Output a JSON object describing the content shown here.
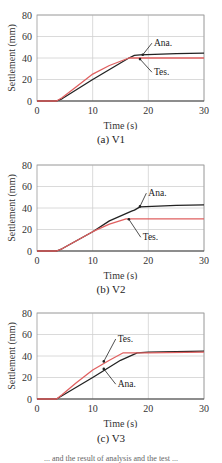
{
  "chart_data": [
    {
      "type": "line",
      "title": "",
      "caption": "(a)   V1",
      "xlabel": "Time (s)",
      "ylabel": "Settlement (mm)",
      "xlim": [
        0,
        30
      ],
      "ylim": [
        0,
        80
      ],
      "xticks": [
        0,
        10,
        20,
        30
      ],
      "yticks": [
        0,
        20,
        40,
        60,
        80
      ],
      "grid": true,
      "series": [
        {
          "name": "Ana.",
          "color": "#222222",
          "x": [
            0,
            3.5,
            4.5,
            10,
            16.5,
            17.5,
            18.5,
            25,
            30
          ],
          "y": [
            0,
            0,
            2,
            20,
            40,
            42.5,
            43,
            44,
            44.5
          ]
        },
        {
          "name": "Tes.",
          "color": "#e06060",
          "x": [
            0,
            3.5,
            4.5,
            7,
            10,
            13,
            16.5,
            30
          ],
          "y": [
            0,
            0,
            3,
            13,
            25,
            33,
            40,
            40
          ]
        }
      ],
      "annotations": [
        {
          "text": "Ana.",
          "x": 21,
          "y": 51,
          "arrow_to": [
            19,
            43
          ]
        },
        {
          "text": "Tes.",
          "x": 21,
          "y": 24,
          "arrow_to": [
            18.5,
            39
          ]
        }
      ]
    },
    {
      "type": "line",
      "title": "",
      "caption": "(b)   V2",
      "xlabel": "Time (s)",
      "ylabel": "Settlement (mm)",
      "xlim": [
        0,
        30
      ],
      "ylim": [
        0,
        80
      ],
      "xticks": [
        0,
        10,
        20,
        30
      ],
      "yticks": [
        0,
        20,
        40,
        60,
        80
      ],
      "grid": true,
      "series": [
        {
          "name": "Ana.",
          "color": "#222222",
          "x": [
            0,
            3.5,
            4.5,
            10,
            13,
            17,
            17.5,
            18.5,
            25,
            30
          ],
          "y": [
            0,
            0,
            2,
            18,
            28,
            37,
            38,
            41,
            42.5,
            43
          ]
        },
        {
          "name": "Tes.",
          "color": "#e06060",
          "x": [
            0,
            3.5,
            4.5,
            10,
            13,
            16,
            30
          ],
          "y": [
            0,
            0,
            2,
            18,
            25,
            30,
            30
          ]
        }
      ],
      "annotations": [
        {
          "text": "Ana.",
          "x": 20,
          "y": 51,
          "arrow_to": [
            18.5,
            41.5
          ]
        },
        {
          "text": "Tes.",
          "x": 19,
          "y": 10,
          "arrow_to": [
            16.5,
            29.5
          ]
        }
      ]
    },
    {
      "type": "line",
      "title": "",
      "caption": "(c)   V3",
      "xlabel": "Time (s)",
      "ylabel": "Settlement (mm)",
      "xlim": [
        0,
        30
      ],
      "ylim": [
        0,
        80
      ],
      "xticks": [
        0,
        10,
        20,
        30
      ],
      "yticks": [
        0,
        20,
        40,
        60,
        80
      ],
      "grid": true,
      "series": [
        {
          "name": "Ana.",
          "color": "#222222",
          "x": [
            0,
            3.5,
            4.5,
            10,
            15,
            18,
            20,
            30
          ],
          "y": [
            0,
            0,
            3,
            20,
            36,
            43,
            43.5,
            44.5
          ]
        },
        {
          "name": "Tes.",
          "color": "#e06060",
          "x": [
            0,
            3.5,
            4.5,
            7,
            10,
            13,
            15.5,
            20,
            30
          ],
          "y": [
            0,
            0,
            4,
            15,
            27,
            36,
            43,
            43,
            43.5
          ]
        }
      ],
      "annotations": [
        {
          "text": "Tes.",
          "x": 14.5,
          "y": 53,
          "arrow_to": [
            12,
            35
          ]
        },
        {
          "text": "Ana.",
          "x": 14.5,
          "y": 11,
          "arrow_to": [
            12,
            28
          ]
        }
      ]
    }
  ],
  "footer_text": "... and the result of analysis and the test ..."
}
